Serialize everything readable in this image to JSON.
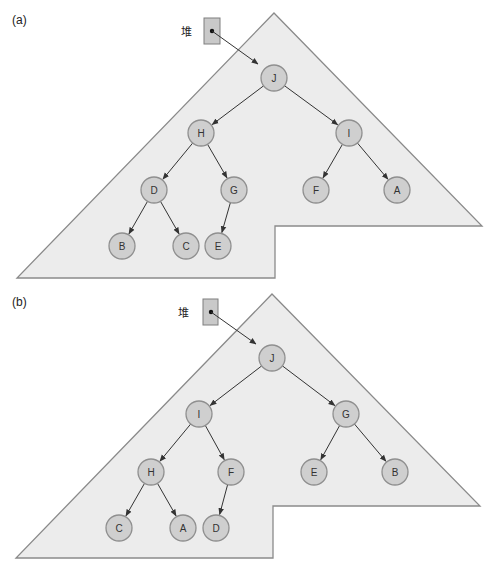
{
  "colors": {
    "region_fill": "#ececec",
    "region_stroke": "#8a8a8a",
    "node_fill": "#cfcfcf",
    "node_stroke": "#8f8f8f",
    "edge": "#333333"
  },
  "panels": [
    {
      "label": "(a)",
      "heap_label": "堆",
      "nodes": [
        {
          "id": "J",
          "label": "J",
          "x": 274,
          "y": 78
        },
        {
          "id": "H",
          "label": "H",
          "x": 201,
          "y": 133
        },
        {
          "id": "I",
          "label": "I",
          "x": 349,
          "y": 133
        },
        {
          "id": "D",
          "label": "D",
          "x": 154,
          "y": 190
        },
        {
          "id": "G",
          "label": "G",
          "x": 234,
          "y": 190
        },
        {
          "id": "F",
          "label": "F",
          "x": 316,
          "y": 190
        },
        {
          "id": "A",
          "label": "A",
          "x": 397,
          "y": 190
        },
        {
          "id": "B",
          "label": "B",
          "x": 122,
          "y": 246
        },
        {
          "id": "C",
          "label": "C",
          "x": 186,
          "y": 246
        },
        {
          "id": "E",
          "label": "E",
          "x": 218,
          "y": 246
        }
      ],
      "edges": [
        [
          "J",
          "H"
        ],
        [
          "J",
          "I"
        ],
        [
          "H",
          "D"
        ],
        [
          "H",
          "G"
        ],
        [
          "I",
          "F"
        ],
        [
          "I",
          "A"
        ],
        [
          "D",
          "B"
        ],
        [
          "D",
          "C"
        ],
        [
          "G",
          "E"
        ]
      ],
      "root": "J"
    },
    {
      "label": "(b)",
      "heap_label": "堆",
      "nodes": [
        {
          "id": "J",
          "label": "J",
          "x": 272,
          "y": 358
        },
        {
          "id": "I",
          "label": "I",
          "x": 199,
          "y": 414
        },
        {
          "id": "G",
          "label": "G",
          "x": 346,
          "y": 414
        },
        {
          "id": "H",
          "label": "H",
          "x": 151,
          "y": 472
        },
        {
          "id": "F",
          "label": "F",
          "x": 231,
          "y": 472
        },
        {
          "id": "E",
          "label": "E",
          "x": 314,
          "y": 472
        },
        {
          "id": "B",
          "label": "B",
          "x": 395,
          "y": 472
        },
        {
          "id": "C",
          "label": "C",
          "x": 119,
          "y": 528
        },
        {
          "id": "A",
          "label": "A",
          "x": 183,
          "y": 528
        },
        {
          "id": "D",
          "label": "D",
          "x": 216,
          "y": 528
        }
      ],
      "edges": [
        [
          "J",
          "I"
        ],
        [
          "J",
          "G"
        ],
        [
          "I",
          "H"
        ],
        [
          "I",
          "F"
        ],
        [
          "G",
          "E"
        ],
        [
          "G",
          "B"
        ],
        [
          "H",
          "C"
        ],
        [
          "H",
          "A"
        ],
        [
          "F",
          "D"
        ]
      ],
      "root": "J"
    }
  ]
}
